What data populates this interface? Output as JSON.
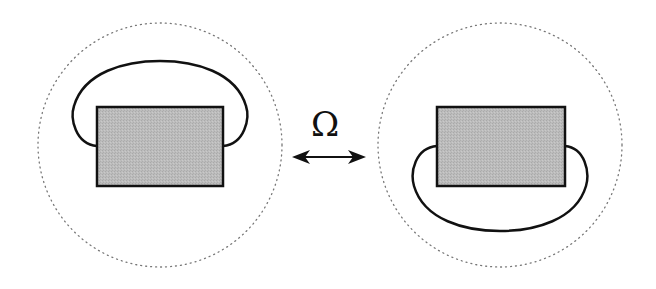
{
  "diagram": {
    "symbol": "Ω",
    "relation": "bidirectional-arrow",
    "colors": {
      "rectangle_fill": "#b8b8b8",
      "stroke": "#111111",
      "dotted_circle": "#777777"
    },
    "panels": [
      {
        "name": "left",
        "loop_position": "above"
      },
      {
        "name": "right",
        "loop_position": "below"
      }
    ]
  }
}
